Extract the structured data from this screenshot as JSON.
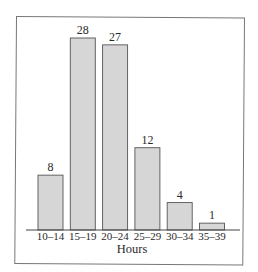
{
  "chart_data": {
    "type": "bar",
    "title": "",
    "xlabel": "Hours",
    "ylabel": "",
    "categories": [
      "10–14",
      "15–19",
      "20–24",
      "25–29",
      "30–34",
      "35–39"
    ],
    "values": [
      8,
      28,
      27,
      12,
      4,
      1
    ],
    "data_labels": [
      "8",
      "28",
      "27",
      "12",
      "4",
      "1"
    ],
    "ylim": [
      0,
      28
    ],
    "grid": false,
    "legend": null,
    "bar_color": "#d6d6d6",
    "bar_edge_color": "#555555"
  }
}
